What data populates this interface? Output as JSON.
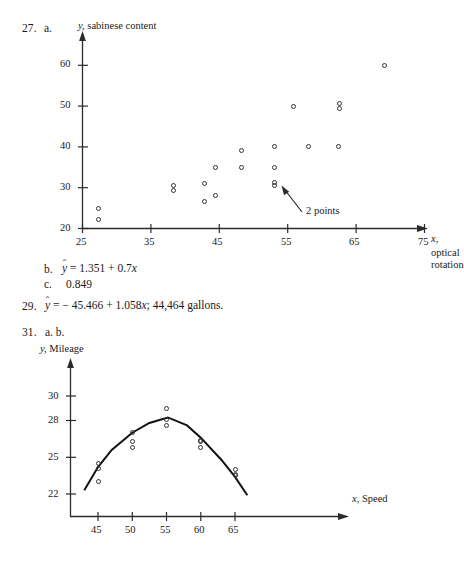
{
  "page": {
    "background": "#ffffff",
    "ink": "#1a1a1a"
  },
  "answers": [
    {
      "number": "27.",
      "parts": [
        {
          "label": "a.",
          "text": ""
        },
        {
          "label": "b.",
          "text": "ŷ = 1.351 + 0.7x"
        },
        {
          "label": "c.",
          "text": "0.849"
        }
      ]
    },
    {
      "number": "29.",
      "parts": [
        {
          "label": "",
          "text": "ŷ = −45.466 + 1.058x; 44,464 gallons."
        }
      ]
    },
    {
      "number": "31.",
      "parts": [
        {
          "label": "a. b.",
          "text": ""
        }
      ]
    }
  ],
  "text_lines": {
    "q27_num": "27.",
    "q27_a": "a.",
    "q27_b_label": "b.",
    "q27_b_eq_hat": "ˆ",
    "q27_b_eq_y": "y",
    "q27_b_eq_rest": "= 1.351 + 0.7",
    "q27_b_eq_x": "x",
    "q27_c_label": "c.",
    "q27_c_value": "0.849",
    "q29_num": "29.",
    "q29_eq_rest": "= − 45.466 + 1.058",
    "q29_eq_x": "x",
    "q29_eq_tail": "; 44,464 gallons.",
    "q31_num": "31.",
    "q31_parts": "a. b."
  },
  "chart_data": [
    {
      "id": "chart-27a",
      "type": "scatter",
      "title": "",
      "xlabel": "x, optical rotation",
      "ylabel": "y, sabinese content",
      "xlabel_parts": {
        "var": "x,",
        "desc_line1": "optical",
        "desc_line2": "rotation"
      },
      "ylabel_parts": {
        "var": "y,",
        "desc": "sabinese content"
      },
      "xlim": [
        25,
        75
      ],
      "ylim": [
        20,
        65
      ],
      "xticks": [
        25,
        35,
        45,
        55,
        65,
        75
      ],
      "yticks": [
        20,
        30,
        40,
        50,
        60
      ],
      "grid": false,
      "legend": false,
      "axis_arrows": true,
      "points": [
        {
          "x": 27.4,
          "y": 25
        },
        {
          "x": 27.4,
          "y": 22.3
        },
        {
          "x": 38.3,
          "y": 30.6
        },
        {
          "x": 38.3,
          "y": 29.4
        },
        {
          "x": 42.9,
          "y": 31
        },
        {
          "x": 42.9,
          "y": 26.5
        },
        {
          "x": 44.5,
          "y": 35
        },
        {
          "x": 44.5,
          "y": 28
        },
        {
          "x": 48.2,
          "y": 39
        },
        {
          "x": 48.2,
          "y": 35
        },
        {
          "x": 53.1,
          "y": 40
        },
        {
          "x": 53.1,
          "y": 35
        },
        {
          "x": 53.1,
          "y": 31.3
        },
        {
          "x": 53.1,
          "y": 30.5
        },
        {
          "x": 55.8,
          "y": 50
        },
        {
          "x": 58.1,
          "y": 40
        },
        {
          "x": 62.5,
          "y": 50.6
        },
        {
          "x": 62.5,
          "y": 49.3
        },
        {
          "x": 62.4,
          "y": 40
        },
        {
          "x": 69.2,
          "y": 60
        }
      ],
      "annotations": [
        {
          "text": "2 points",
          "target": {
            "x": 53.1,
            "y": 30.9
          },
          "note": "arrow points to two overlapping markers"
        }
      ]
    },
    {
      "id": "chart-31ab",
      "type": "scatter",
      "title": "",
      "xlabel": "x, Speed",
      "ylabel": "y, Mileage",
      "xlabel_parts": {
        "var": "x,",
        "desc": "Speed"
      },
      "ylabel_parts": {
        "var": "y,",
        "desc": "Mileage"
      },
      "xlim": [
        42.5,
        67.5
      ],
      "ylim": [
        21.2,
        31
      ],
      "xticks": [
        45,
        50,
        55,
        60,
        65
      ],
      "yticks": [
        22,
        25,
        28,
        30
      ],
      "grid": false,
      "legend": false,
      "axis_arrows": true,
      "points": [
        {
          "x": 45.0,
          "y": 24.5
        },
        {
          "x": 45.0,
          "y": 24.1
        },
        {
          "x": 45.0,
          "y": 23.0
        },
        {
          "x": 50.0,
          "y": 27.0
        },
        {
          "x": 50.0,
          "y": 26.3
        },
        {
          "x": 50.0,
          "y": 25.8
        },
        {
          "x": 55.0,
          "y": 29.0
        },
        {
          "x": 55.0,
          "y": 28.1
        },
        {
          "x": 55.0,
          "y": 27.6
        },
        {
          "x": 60.0,
          "y": 26.4
        },
        {
          "x": 60.0,
          "y": 26.3
        },
        {
          "x": 60.0,
          "y": 25.8
        },
        {
          "x": 65.0,
          "y": 24.0
        },
        {
          "x": 65.0,
          "y": 23.6
        },
        {
          "x": 65.0,
          "y": 23.5
        }
      ],
      "fit_curve": {
        "kind": "quadratic",
        "description": "fitted parabola through the mileage-vs-speed data",
        "vertex": {
          "x": 55.2,
          "y": 28.25
        },
        "sample_points": [
          {
            "x": 43.0,
            "y": 22.3
          },
          {
            "x": 45.0,
            "y": 24.2
          },
          {
            "x": 47.0,
            "y": 25.6
          },
          {
            "x": 50.0,
            "y": 27.0
          },
          {
            "x": 52.5,
            "y": 27.8
          },
          {
            "x": 55.2,
            "y": 28.25
          },
          {
            "x": 58.0,
            "y": 27.6
          },
          {
            "x": 60.0,
            "y": 26.6
          },
          {
            "x": 63.0,
            "y": 24.8
          },
          {
            "x": 65.0,
            "y": 23.4
          },
          {
            "x": 66.8,
            "y": 21.9
          }
        ]
      },
      "annotations": []
    }
  ]
}
